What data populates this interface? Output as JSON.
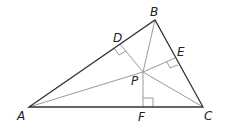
{
  "diagram": {
    "points": {
      "A": {
        "label": "A",
        "x": 29,
        "y": 107
      },
      "B": {
        "label": "B",
        "x": 155,
        "y": 20
      },
      "C": {
        "label": "C",
        "x": 203,
        "y": 107
      },
      "P": {
        "label": "P",
        "x": 143,
        "y": 72
      },
      "D": {
        "label": "D",
        "x": 120,
        "y": 44
      },
      "E": {
        "label": "E",
        "x": 175,
        "y": 58
      },
      "F": {
        "label": "F",
        "x": 143,
        "y": 107
      }
    },
    "colors": {
      "triangle": "#333333",
      "segments": "#999999",
      "right_angle": "#999999"
    }
  }
}
